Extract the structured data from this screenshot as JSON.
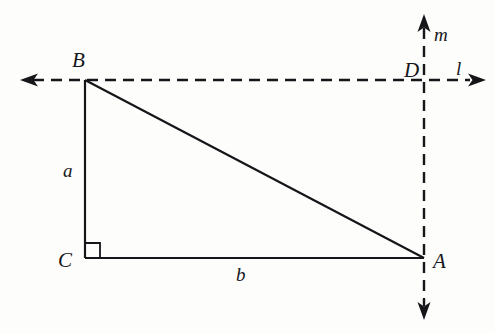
{
  "figure": {
    "background_color": "#fdfdfb",
    "stroke_color": "#16161a"
  },
  "vertices": {
    "B": {
      "label": "B",
      "x": 85,
      "y": 80
    },
    "C": {
      "label": "C",
      "x": 85,
      "y": 258
    },
    "A": {
      "label": "A",
      "x": 424,
      "y": 258
    },
    "D": {
      "label": "D",
      "x": 424,
      "y": 80
    }
  },
  "sides": {
    "a": {
      "label": "a",
      "from": "B",
      "to": "C"
    },
    "b": {
      "label": "b",
      "from": "C",
      "to": "A"
    },
    "hypotenuse": {
      "label": "",
      "from": "B",
      "to": "A"
    }
  },
  "lines": {
    "l": {
      "label": "l",
      "orientation": "horizontal",
      "style": "dashed",
      "y": 80,
      "x_start": 20,
      "x_end": 486
    },
    "m": {
      "label": "m",
      "orientation": "vertical",
      "style": "dashed",
      "x": 424,
      "y_start": 14,
      "y_end": 320
    }
  },
  "markers": {
    "right_angle": {
      "at": "C",
      "size": 15,
      "label": "right-angle"
    }
  },
  "arrows": {
    "left": "arrow-left",
    "right": "arrow-right",
    "up": "arrow-up",
    "down": "arrow-down"
  }
}
